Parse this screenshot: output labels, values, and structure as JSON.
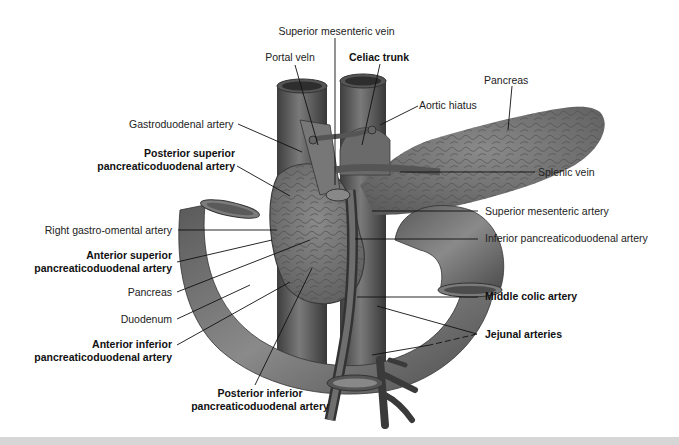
{
  "figure": {
    "labels": {
      "superior_mesenteric_vein": "Superior mesenteric vein",
      "portal_vein": "Portal veln",
      "celiac_trunk": "Celiac trunk",
      "pancreas_top": "Pancreas",
      "aortic_hiatus": "Aortic hiatus",
      "gastroduodenal_artery": "Gastroduodenal artery",
      "posterior_superior_1": "Posterior superior",
      "posterior_superior_2": "pancreaticoduodenal artery",
      "splenic_vein": "Splenic vein",
      "right_gastro_omental": "Right gastro-omental artery",
      "superior_mesenteric_artery": "Superior mesenteric artery",
      "anterior_superior_1": "Anterior superior",
      "anterior_superior_2": "pancreaticoduodenal artery",
      "inferior_pancreaticoduodenal": "Inferior pancreaticoduodenal artery",
      "pancreas_left": "Pancreas",
      "middle_colic_artery": "Middle colic artery",
      "duodenum": "Duodenum",
      "anterior_inferior_1": "Anterior inferior",
      "anterior_inferior_2": "pancreaticoduodenal artery",
      "jejunal_arteries": "Jejunal arteries",
      "posterior_inferior_1": "Posterior inferior",
      "posterior_inferior_2": "pancreaticoduodenal artery"
    },
    "bold_labels": [
      "Celiac trunk",
      "Posterior superior pancreaticoduodenal artery",
      "Anterior superior pancreaticoduodenal artery",
      "Middle colic artery",
      "Anterior inferior pancreaticoduodenal artery",
      "Jejunal arteries",
      "Posterior inferior pancreaticoduodenal artery"
    ],
    "colors": {
      "tissue_dark": "#4a4a4a",
      "tissue_mid": "#6e6e6e",
      "tissue_light": "#8c8c8c",
      "leader": "#111111",
      "background": "#ffffff"
    }
  }
}
